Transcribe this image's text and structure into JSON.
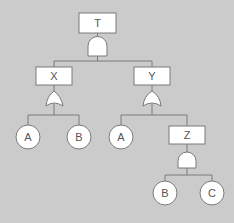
{
  "diagram": {
    "type": "fault-tree",
    "colors": {
      "background": "#cbcbcb",
      "fill": "#ffffff",
      "stroke": "#7a7a7a",
      "text": "#555555"
    },
    "events": {
      "T": {
        "label": "T",
        "kind": "intermediate"
      },
      "X": {
        "label": "X",
        "kind": "intermediate"
      },
      "Y": {
        "label": "Y",
        "kind": "intermediate"
      },
      "Z": {
        "label": "Z",
        "kind": "intermediate"
      },
      "A1": {
        "label": "A",
        "kind": "basic"
      },
      "B1": {
        "label": "B",
        "kind": "basic"
      },
      "A2": {
        "label": "A",
        "kind": "basic"
      },
      "B2": {
        "label": "B",
        "kind": "basic"
      },
      "C": {
        "label": "C",
        "kind": "basic"
      }
    },
    "gates": [
      {
        "id": "gate-T",
        "type": "AND",
        "output": "T",
        "inputs": [
          "X",
          "Y"
        ]
      },
      {
        "id": "gate-X",
        "type": "OR",
        "output": "X",
        "inputs": [
          "A1",
          "B1"
        ]
      },
      {
        "id": "gate-Y",
        "type": "OR",
        "output": "Y",
        "inputs": [
          "A2",
          "Z"
        ]
      },
      {
        "id": "gate-Z",
        "type": "AND",
        "output": "Z",
        "inputs": [
          "B2",
          "C"
        ]
      }
    ]
  }
}
